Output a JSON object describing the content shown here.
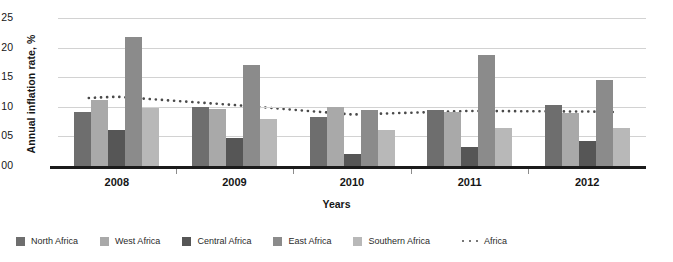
{
  "chart_data": {
    "type": "bar",
    "title": "",
    "xlabel": "Years",
    "ylabel": "Annual inflation rate, %",
    "categories": [
      "2008",
      "2009",
      "2010",
      "2011",
      "2012"
    ],
    "ylim": [
      0,
      25
    ],
    "yticks": [
      "00",
      "05",
      "10",
      "15",
      "20",
      "25"
    ],
    "ytick_values": [
      0,
      5,
      10,
      15,
      20,
      25
    ],
    "grid": true,
    "legend_position": "bottom",
    "series": [
      {
        "name": "North Africa",
        "type": "bar",
        "color": "#6e6e6e",
        "values": [
          9.2,
          10.0,
          8.2,
          9.5,
          10.3
        ]
      },
      {
        "name": "West Africa",
        "type": "bar",
        "color": "#a9a9a9",
        "values": [
          11.2,
          9.7,
          10.0,
          9.2,
          9.0
        ]
      },
      {
        "name": "Central Africa",
        "type": "bar",
        "color": "#565656",
        "values": [
          6.0,
          4.7,
          2.0,
          3.2,
          4.3
        ]
      },
      {
        "name": "East Africa",
        "type": "bar",
        "color": "#8b8b8b",
        "values": [
          21.8,
          17.0,
          9.5,
          18.7,
          14.5
        ]
      },
      {
        "name": "Southern Africa",
        "type": "bar",
        "color": "#b8b8b8",
        "values": [
          9.8,
          8.0,
          6.0,
          6.5,
          6.5
        ]
      },
      {
        "name": "Africa",
        "type": "line",
        "color": "#4a4a4a",
        "style": "dotted",
        "values": [
          11.7,
          10.3,
          8.7,
          9.3,
          9.2
        ]
      }
    ]
  },
  "legend": {
    "items": [
      {
        "label": "North Africa",
        "marker": "square-swatch-north-africa"
      },
      {
        "label": "West Africa",
        "marker": "square-swatch-west-africa"
      },
      {
        "label": "Central Africa",
        "marker": "square-swatch-central-africa"
      },
      {
        "label": "East Africa",
        "marker": "square-swatch-east-africa"
      },
      {
        "label": "Southern Africa",
        "marker": "square-swatch-southern-africa"
      },
      {
        "label": "Africa",
        "marker": "dotted-line-swatch-africa"
      }
    ]
  }
}
